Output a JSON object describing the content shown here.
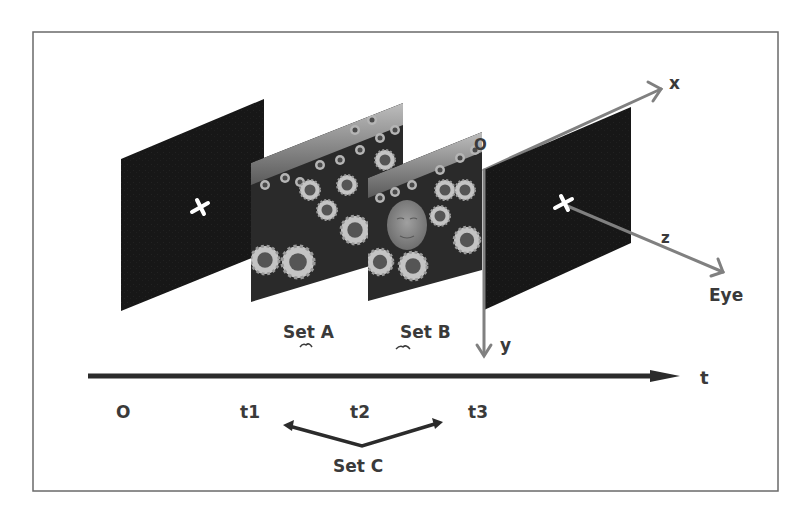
{
  "diagram": {
    "frame": {
      "x": 33,
      "y": 32,
      "width": 745,
      "height": 459,
      "stroke": "#6a6a6a"
    },
    "colors": {
      "panel_black": "#161616",
      "flower_bg": "#2a2a2a",
      "flower_petal": "#b8b8b8",
      "flower_center": "#555555",
      "axis_gray": "#808080",
      "timeline": "#2b2b2b",
      "text": "#3a3a3a",
      "face": "#8a8a8a"
    },
    "panels": [
      {
        "id": "fixation-1",
        "kind": "fixation",
        "label": "fixation cross screen (time O)"
      },
      {
        "id": "set-a",
        "kind": "sunflower-scene",
        "label": "sunflower scene"
      },
      {
        "id": "set-b",
        "kind": "sunflower-scene-with-face",
        "label": "sunflower scene with face"
      },
      {
        "id": "fixation-2",
        "kind": "fixation",
        "label": "fixation cross screen (time t3)"
      }
    ],
    "axes": {
      "x_label": "x",
      "y_label": "y",
      "z_label": "z",
      "origin_label": "O",
      "eye_label": "Eye"
    },
    "set_labels": {
      "set_a": "Set A",
      "set_b": "Set B",
      "set_c": "Set C"
    },
    "timeline": {
      "axis_label": "t",
      "ticks": [
        "O",
        "t1",
        "t2",
        "t3"
      ]
    }
  }
}
